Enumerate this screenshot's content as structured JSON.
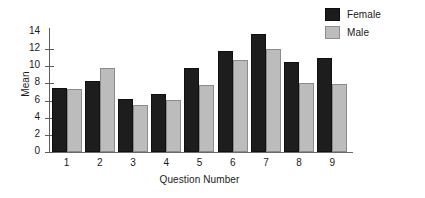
{
  "chart_data": {
    "type": "bar",
    "title": "",
    "xlabel": "Question Number",
    "ylabel": "Mean",
    "categories": [
      "1",
      "2",
      "3",
      "4",
      "5",
      "6",
      "7",
      "8",
      "9"
    ],
    "series": [
      {
        "name": "Female",
        "color": "#1d1d1d",
        "values": [
          7.5,
          8.3,
          6.2,
          6.8,
          9.8,
          11.8,
          13.8,
          10.5,
          11.0
        ]
      },
      {
        "name": "Male",
        "color": "#bcbcbc",
        "values": [
          7.3,
          9.8,
          5.5,
          6.1,
          7.8,
          10.7,
          12.0,
          8.0,
          7.9
        ]
      }
    ],
    "ylim": [
      0,
      14
    ],
    "yticks": [
      "0",
      "2",
      "4",
      "6",
      "8",
      "10",
      "12",
      "14"
    ],
    "ytick_values": [
      0,
      2,
      4,
      6,
      8,
      10,
      12,
      14
    ],
    "grid": false,
    "legend_position": "top-right"
  },
  "legend": {
    "entries": [
      {
        "label": "Female"
      },
      {
        "label": "Male"
      }
    ]
  }
}
